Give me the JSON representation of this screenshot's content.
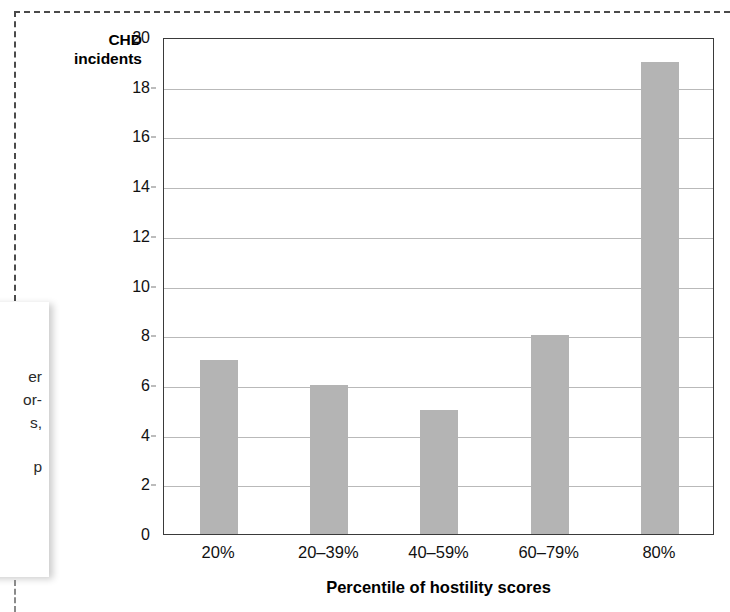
{
  "chart_data": {
    "type": "bar",
    "title": "",
    "categories": [
      "20%",
      "20–39%",
      "40–59%",
      "60–79%",
      "80%"
    ],
    "values": [
      7,
      6,
      5,
      8,
      19
    ],
    "xlabel": "Percentile of hostility scores",
    "ylabel": "CHD incidents",
    "ylabel_lines": [
      "CHD",
      "incidents"
    ],
    "ylim": [
      0,
      20
    ],
    "yticks": [
      0,
      2,
      4,
      6,
      8,
      10,
      12,
      14,
      16,
      18,
      20
    ],
    "ytick_labels": [
      "0",
      "2",
      "4",
      "6",
      "8",
      "10",
      "12",
      "14",
      "16",
      "18",
      "20"
    ],
    "grid": true,
    "legend": "none",
    "bar_color": "#b4b4b4",
    "plot_border_color": "#3a3a3a",
    "gridline_color": "#b9b9b9",
    "background": "#ffffff"
  },
  "page": {
    "crop_marks": {
      "style": "dashed",
      "color": "#4a4a4a"
    },
    "side_note": {
      "visible_fragments": [
        "er",
        "or-",
        "s,",
        "p"
      ]
    }
  }
}
